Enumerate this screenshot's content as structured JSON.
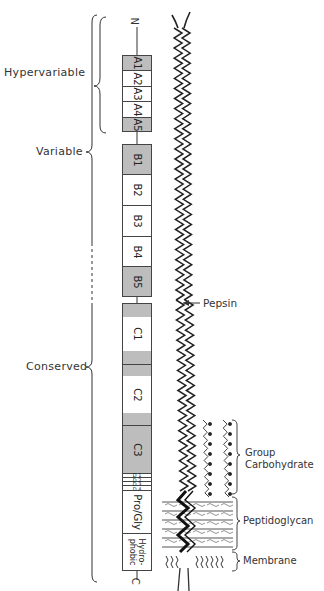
{
  "diagram": {
    "termini": {
      "n": "N",
      "c": "C"
    },
    "regions": [
      {
        "label": "Hypervariable"
      },
      {
        "label": "Variable"
      },
      {
        "label": "Conserved"
      }
    ],
    "segments": [
      {
        "id": "A1",
        "label": "A1",
        "shaded": true
      },
      {
        "id": "A2",
        "label": "A2",
        "shaded": false
      },
      {
        "id": "A3",
        "label": "A3",
        "shaded": false
      },
      {
        "id": "A4",
        "label": "A4",
        "shaded": false
      },
      {
        "id": "A5",
        "label": "A5",
        "shaded": true
      },
      {
        "id": "B1",
        "label": "B1",
        "shaded": true
      },
      {
        "id": "B2",
        "label": "B2",
        "shaded": false
      },
      {
        "id": "B3",
        "label": "B3",
        "shaded": false
      },
      {
        "id": "B4",
        "label": "B4",
        "shaded": false
      },
      {
        "id": "B5",
        "label": "B5",
        "shaded": true
      },
      {
        "id": "C1",
        "label": "C1",
        "shaded": "partial"
      },
      {
        "id": "C2",
        "label": "C2",
        "shaded": "partial"
      },
      {
        "id": "C3",
        "label": "C3",
        "shaded": true
      },
      {
        "id": "D1",
        "label": "D 1",
        "shaded": false
      },
      {
        "id": "D2",
        "label": "D 2",
        "shaded": false
      },
      {
        "id": "D3",
        "label": "D 3",
        "shaded": false
      },
      {
        "id": "D4",
        "label": "D 4",
        "shaded": false
      },
      {
        "id": "ProGly",
        "label": "Pro/Gly",
        "shaded": false
      },
      {
        "id": "Hydrophobic",
        "label": "Hydro-\nphobic",
        "label_line1": "Hydro-",
        "label_line2": "phobic",
        "shaded": false
      }
    ],
    "annotations": {
      "pepsin": "Pepsin",
      "group_carbohydrate_line1": "Group",
      "group_carbohydrate_line2": "Carbohydrate",
      "peptidoglycan": "Peptidoglycan",
      "membrane": "Membrane"
    },
    "colors": {
      "shade": "#bdbdbd",
      "line": "#333333",
      "background": "#ffffff"
    }
  }
}
